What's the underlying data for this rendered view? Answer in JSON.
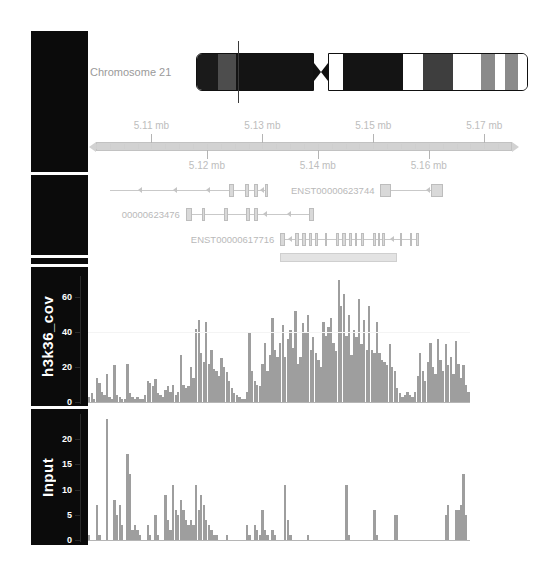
{
  "ideogram": {
    "chromosome_label": "Chromosome 21",
    "marker_position_mb": 5.13,
    "bands": [
      {
        "arm": "p",
        "start": 0.0,
        "end": 0.175,
        "stain": "gneg_dark",
        "color": "#1a1a1a"
      },
      {
        "arm": "p",
        "start": 0.175,
        "end": 0.33,
        "stain": "gpos50",
        "color": "#4d4d4d"
      },
      {
        "arm": "p",
        "start": 0.33,
        "end": 1.0,
        "stain": "gpos100",
        "color": "#141414"
      },
      {
        "arm": "q",
        "start": 0.0,
        "end": 0.072,
        "stain": "gneg",
        "color": "#ffffff"
      },
      {
        "arm": "q",
        "start": 0.072,
        "end": 0.37,
        "stain": "gpos100",
        "color": "#141414"
      },
      {
        "arm": "q",
        "start": 0.37,
        "end": 0.47,
        "stain": "gneg",
        "color": "#ffffff"
      },
      {
        "arm": "q",
        "start": 0.47,
        "end": 0.618,
        "stain": "gpos75",
        "color": "#3e3e3e"
      },
      {
        "arm": "q",
        "start": 0.618,
        "end": 0.762,
        "stain": "gneg",
        "color": "#ffffff"
      },
      {
        "arm": "q",
        "start": 0.762,
        "end": 0.83,
        "stain": "gpos50",
        "color": "#8a8a8a"
      },
      {
        "arm": "q",
        "start": 0.83,
        "end": 0.878,
        "stain": "gneg",
        "color": "#ffffff"
      },
      {
        "arm": "q",
        "start": 0.878,
        "end": 0.947,
        "stain": "gpos50",
        "color": "#8a8a8a"
      },
      {
        "arm": "q",
        "start": 0.947,
        "end": 1.0,
        "stain": "gneg",
        "color": "#ffffff"
      }
    ]
  },
  "ruler": {
    "start_mb": 5.1,
    "end_mb": 5.175,
    "labels_above": [
      "5.11 mb",
      "5.13 mb",
      "5.15 mb",
      "5.17 mb"
    ],
    "labels_below": [
      "5.12 mb",
      "5.14 mb",
      "5.16 mb"
    ],
    "ticks_above_mb": [
      5.11,
      5.13,
      5.15,
      5.17
    ],
    "ticks_below_mb": [
      5.12,
      5.14,
      5.16
    ]
  },
  "genes": {
    "transcripts": [
      {
        "label": "",
        "row": 0,
        "strand": "-",
        "span": [
          0.035,
          0.425
        ],
        "exons": [
          [
            0.33,
            0.341
          ],
          [
            0.368,
            0.378
          ],
          [
            0.392,
            0.402
          ],
          [
            0.418,
            0.427
          ]
        ],
        "arrow_positions": [
          0.105,
          0.19,
          0.272,
          0.405
        ]
      },
      {
        "label": "00000623476",
        "row": 1,
        "strand": "-",
        "span": [
          0.222,
          0.54
        ],
        "exons": [
          [
            0.222,
            0.238
          ],
          [
            0.262,
            0.271
          ],
          [
            0.318,
            0.327
          ],
          [
            0.372,
            0.381
          ],
          [
            0.392,
            0.401
          ],
          [
            0.527,
            0.54
          ]
        ],
        "arrow_positions": [
          0.414,
          0.472
        ]
      },
      {
        "label": "ENST00000623744",
        "row": 0,
        "strand": "-",
        "span": [
          0.703,
          0.86
        ],
        "exons": [
          [
            0.703,
            0.729
          ],
          [
            0.828,
            0.86
          ]
        ],
        "arrow_positions": [
          0.818
        ]
      },
      {
        "label": "ENST00000617716",
        "row": 2,
        "strand": "-",
        "span": [
          0.455,
          0.8
        ],
        "exons": [
          [
            0.455,
            0.468
          ],
          [
            0.492,
            0.502
          ],
          [
            0.509,
            0.519
          ],
          [
            0.527,
            0.534
          ],
          [
            0.543,
            0.55
          ],
          [
            0.566,
            0.572
          ],
          [
            0.595,
            0.602
          ],
          [
            0.61,
            0.62
          ],
          [
            0.626,
            0.633
          ],
          [
            0.64,
            0.647
          ],
          [
            0.657,
            0.663
          ],
          [
            0.686,
            0.693
          ],
          [
            0.697,
            0.704
          ],
          [
            0.708,
            0.715
          ],
          [
            0.752,
            0.758
          ],
          [
            0.776,
            0.782
          ],
          [
            0.792,
            0.799
          ]
        ],
        "arrow_positions": [
          0.476,
          0.728
        ]
      }
    ],
    "region_bar": {
      "span": [
        0.455,
        0.745
      ]
    }
  },
  "chart_data": [
    {
      "type": "bar",
      "name": "h3k36_cov",
      "title": "h3k36_cov",
      "ylabel": "h3k36_cov",
      "xlabel": "",
      "ylim": [
        0,
        72
      ],
      "yticks": [
        0,
        20,
        40,
        60
      ],
      "ytick_labels": [
        "0",
        "20",
        "40",
        "60"
      ],
      "grid": false,
      "bar_color": "#9e9e9e",
      "n_bins": 150,
      "values": [
        3,
        5,
        2,
        14,
        11,
        6,
        4,
        16,
        3,
        2,
        21,
        4,
        3,
        2,
        2,
        22,
        5,
        3,
        2,
        3,
        2,
        2,
        4,
        12,
        11,
        9,
        13,
        5,
        4,
        3,
        7,
        9,
        6,
        10,
        4,
        6,
        27,
        10,
        8,
        9,
        20,
        14,
        42,
        47,
        28,
        23,
        46,
        22,
        30,
        19,
        18,
        15,
        25,
        20,
        17,
        12,
        8,
        5,
        4,
        3,
        2,
        2,
        6,
        40,
        18,
        12,
        10,
        9,
        22,
        34,
        18,
        27,
        48,
        30,
        26,
        34,
        44,
        26,
        36,
        41,
        31,
        52,
        22,
        26,
        45,
        40,
        50,
        30,
        37,
        28,
        24,
        20,
        46,
        38,
        43,
        48,
        34,
        29,
        70,
        55,
        62,
        38,
        50,
        27,
        41,
        37,
        59,
        33,
        47,
        30,
        55,
        30,
        28,
        46,
        28,
        24,
        23,
        21,
        33,
        20,
        18,
        8,
        5,
        3,
        4,
        6,
        4,
        3,
        6,
        15,
        28,
        18,
        12,
        23,
        34,
        20,
        16,
        36,
        24,
        18,
        33,
        21,
        26,
        16,
        35,
        22,
        14,
        21,
        10,
        6
      ]
    },
    {
      "type": "bar",
      "name": "Input",
      "title": "Input",
      "ylabel": "Input",
      "xlabel": "",
      "ylim": [
        0,
        25
      ],
      "yticks": [
        0,
        5,
        10,
        15,
        20
      ],
      "ytick_labels": [
        "0",
        "5",
        "10",
        "15",
        "20"
      ],
      "grid": false,
      "bar_color": "#9e9e9e",
      "n_bins": 150,
      "values": [
        1,
        0,
        0,
        7,
        1,
        0,
        0,
        24,
        0,
        0,
        8,
        5,
        7,
        3,
        0,
        17,
        13,
        2,
        3,
        2,
        1,
        0,
        0,
        3,
        1,
        0,
        5,
        1,
        0,
        0,
        9,
        4,
        2,
        11,
        6,
        5,
        8,
        6,
        4,
        3,
        4,
        3,
        11,
        6,
        9,
        7,
        4,
        3,
        2,
        1,
        1,
        0,
        0,
        0,
        1,
        0,
        0,
        0,
        0,
        0,
        0,
        0,
        3,
        1,
        0,
        3,
        2,
        1,
        6,
        2,
        1,
        0,
        2,
        1,
        0,
        0,
        0,
        11,
        4,
        1,
        0,
        0,
        0,
        0,
        0,
        0,
        1,
        0,
        0,
        0,
        0,
        0,
        0,
        0,
        0,
        0,
        0,
        0,
        0,
        0,
        0,
        11,
        1,
        0,
        0,
        0,
        0,
        0,
        0,
        0,
        0,
        0,
        6,
        1,
        0,
        0,
        0,
        0,
        0,
        0,
        5,
        5,
        0,
        0,
        0,
        0,
        0,
        0,
        0,
        0,
        0,
        0,
        0,
        0,
        0,
        0,
        0,
        0,
        0,
        0,
        5,
        7,
        0,
        0,
        6,
        6,
        7,
        13,
        5,
        0
      ]
    }
  ]
}
